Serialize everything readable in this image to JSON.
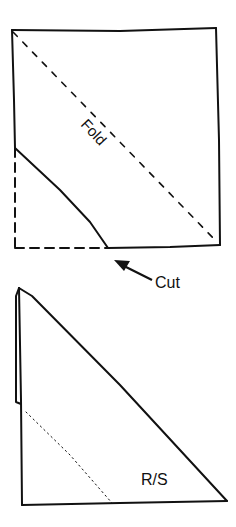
{
  "diagram": {
    "stroke_color": "#111111",
    "background": "#ffffff",
    "step1": {
      "shape": "square",
      "fold_label": "Fold",
      "fold_line": "dashed diagonal from top-left to bottom-right",
      "cut_line": "solid line across lower-left corner",
      "cut_label": "Cut",
      "cut_arrow": "arrow pointing up-left toward cut end"
    },
    "step2": {
      "shape": "right triangle (folded)",
      "side_label": "R/S",
      "stitch_line": "dotted line parallel to hypotenuse, lower-left"
    }
  }
}
